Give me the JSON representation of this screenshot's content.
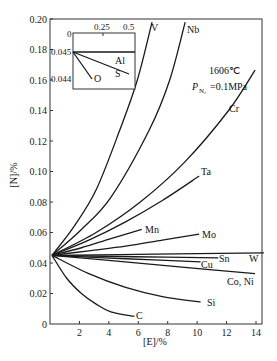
{
  "chart_data": {
    "type": "line",
    "title": "",
    "xlabel": "[E]/%",
    "ylabel": "[N]/%",
    "xlim": [
      0,
      14
    ],
    "ylim": [
      0,
      0.2
    ],
    "x_ticks": [
      "0",
      "2",
      "4",
      "6",
      "8",
      "10",
      "12",
      "14"
    ],
    "y_ticks": [
      "0",
      "0.02",
      "0.04",
      "0.06",
      "0.08",
      "0.10",
      "0.12",
      "0.14",
      "0.16",
      "0.18",
      "0.20"
    ],
    "grid": false,
    "annotation": {
      "temperature": "1606℃",
      "pressure": "=0.1MPa",
      "pressure_symbol": "P",
      "pressure_subscript": "N₂"
    },
    "series": [
      {
        "name": "V",
        "x": [
          0,
          1.5,
          3,
          4.6,
          5.8,
          6.8
        ],
        "y": [
          0.045,
          0.064,
          0.088,
          0.127,
          0.16,
          0.198
        ]
      },
      {
        "name": "Nb",
        "x": [
          0,
          2,
          4,
          6.6,
          8,
          9.05
        ],
        "y": [
          0.045,
          0.062,
          0.083,
          0.127,
          0.16,
          0.198
        ]
      },
      {
        "name": "Cr",
        "x": [
          0,
          3,
          6,
          9,
          12,
          13.8
        ],
        "y": [
          0.045,
          0.06,
          0.08,
          0.106,
          0.14,
          0.1665
        ]
      },
      {
        "name": "Ta",
        "x": [
          0,
          2.5,
          5,
          7.5,
          10
        ],
        "y": [
          0.045,
          0.055,
          0.067,
          0.081,
          0.097
        ]
      },
      {
        "name": "Mn",
        "x": [
          0,
          2,
          4,
          6.1
        ],
        "y": [
          0.045,
          0.05,
          0.056,
          0.062
        ]
      },
      {
        "name": "Mo",
        "x": [
          0,
          2.5,
          5,
          7.5,
          10
        ],
        "y": [
          0.045,
          0.048,
          0.051,
          0.055,
          0.059
        ]
      },
      {
        "name": "W",
        "x": [
          0,
          7,
          14.4
        ],
        "y": [
          0.045,
          0.0458,
          0.0466
        ]
      },
      {
        "name": "Sn",
        "x": [
          0,
          5.6,
          11.3
        ],
        "y": [
          0.045,
          0.0441,
          0.0433
        ]
      },
      {
        "name": "Cu",
        "x": [
          0,
          5,
          10.1
        ],
        "y": [
          0.045,
          0.0428,
          0.0407
        ]
      },
      {
        "name": "Co, Ni",
        "x": [
          0,
          4.6,
          9.2,
          13.8
        ],
        "y": [
          0.045,
          0.041,
          0.037,
          0.033
        ]
      },
      {
        "name": "Si",
        "x": [
          0,
          2.5,
          5,
          7.5,
          10.1
        ],
        "y": [
          0.045,
          0.033,
          0.024,
          0.018,
          0.0144
        ]
      },
      {
        "name": "C",
        "x": [
          0,
          1,
          2,
          3,
          4,
          5.6
        ],
        "y": [
          0.045,
          0.03,
          0.02,
          0.013,
          0.008,
          0.005
        ]
      }
    ],
    "inset": {
      "x_ticks": [
        "0",
        "0.25",
        "0.5"
      ],
      "y_ticks": [
        "0.045",
        "0.044"
      ],
      "xlim": [
        0,
        0.5
      ],
      "ylim": [
        0.0437,
        0.0457
      ],
      "series": [
        {
          "name": "Al",
          "x": [
            0,
            0.5
          ],
          "y": [
            0.045,
            0.045
          ]
        },
        {
          "name": "S",
          "x": [
            0,
            0.5
          ],
          "y": [
            0.045,
            0.0442
          ]
        },
        {
          "name": "O",
          "x": [
            0,
            0.19
          ],
          "y": [
            0.045,
            0.044
          ]
        }
      ]
    }
  }
}
